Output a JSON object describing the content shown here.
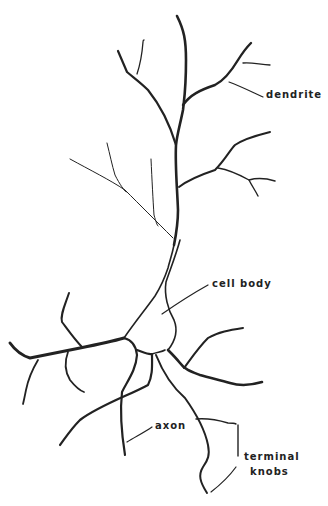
{
  "diagram": {
    "background_color": "#ffffff",
    "ink_color": "#222222",
    "labels": {
      "dendrite": "dendrite",
      "cell_body": "cell body",
      "axon": "axon",
      "terminal_knobs_line1": "terminal",
      "terminal_knobs_line2": "knobs"
    }
  }
}
